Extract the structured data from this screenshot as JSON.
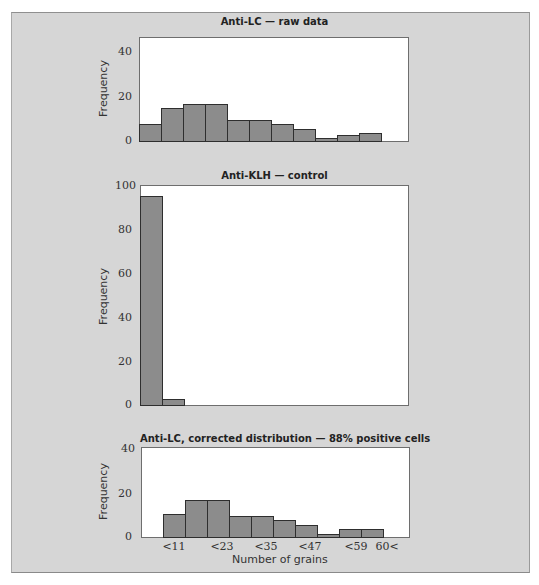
{
  "figure": {
    "xlabel": "Number of grains",
    "ylabel": "Frequency",
    "xticks": [
      "<11",
      "<23",
      "<35",
      "<47",
      "<59",
      "60<"
    ]
  },
  "chart_data": [
    {
      "type": "bar",
      "title": "Anti-LC — raw data",
      "xlabel": "",
      "ylabel": "Frequency",
      "ylim": [
        0,
        46
      ],
      "yticks": [
        0,
        20,
        40
      ],
      "bins": 11,
      "values": [
        8,
        15,
        17,
        17,
        10,
        10,
        8,
        6,
        2,
        3,
        4
      ],
      "bar_color": "#8c8c8c"
    },
    {
      "type": "bar",
      "title": "Anti-KLH — control",
      "xlabel": "",
      "ylabel": "Frequency",
      "ylim": [
        0,
        100
      ],
      "yticks": [
        0,
        20,
        40,
        60,
        80,
        100
      ],
      "bins": 11,
      "values": [
        96,
        3,
        0,
        0,
        0,
        0,
        0,
        0,
        0,
        0,
        0
      ],
      "bar_color": "#8c8c8c"
    },
    {
      "type": "bar",
      "title": "Anti-LC, corrected distribution — 88% positive cells",
      "xlabel": "Number of grains",
      "ylabel": "Frequency",
      "ylim": [
        0,
        40
      ],
      "yticks": [
        0,
        20,
        40
      ],
      "bins": 11,
      "categories_ticks": [
        "<11",
        "<23",
        "<35",
        "<47",
        "<59",
        "60<"
      ],
      "values": [
        0,
        11,
        17,
        17,
        10,
        10,
        8,
        6,
        2,
        4,
        4
      ],
      "bar_color": "#8c8c8c"
    }
  ]
}
